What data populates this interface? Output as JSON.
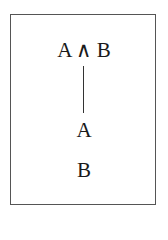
{
  "diagram": {
    "type": "proof-tree",
    "nodes": [
      {
        "id": "root",
        "label": "A ∧ B"
      },
      {
        "id": "child1",
        "label": "A"
      },
      {
        "id": "child2",
        "label": "B"
      }
    ],
    "edges": [
      {
        "from": "root",
        "to": "child1"
      }
    ]
  }
}
